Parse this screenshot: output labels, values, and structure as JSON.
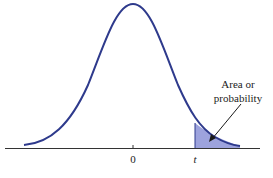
{
  "figure": {
    "type": "t-distribution-right-tail",
    "labels": {
      "zero": "0",
      "t": "t",
      "annotation_line1": "Area or",
      "annotation_line2": "probability"
    },
    "colors": {
      "curve": "#2e3a8c",
      "shaded_area": "#9da3dd",
      "axis": "#333333",
      "arrow": "#1a1a1a",
      "background": "#ffffff"
    }
  }
}
